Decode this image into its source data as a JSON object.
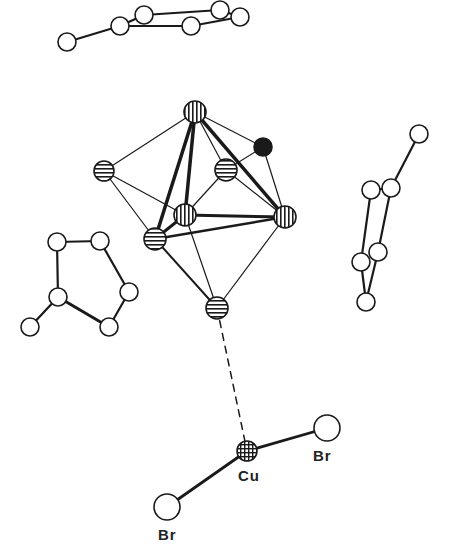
{
  "figure": {
    "colors": {
      "ink": "#1a1a1a",
      "paper": "#ffffff"
    }
  },
  "labels": [
    {
      "id": "cu",
      "text": "Cu",
      "x": 238,
      "y": 467
    },
    {
      "id": "br-right",
      "text": "Br",
      "x": 313,
      "y": 447
    },
    {
      "id": "br-left",
      "text": "Br",
      "x": 158,
      "y": 526
    }
  ],
  "atoms": [
    {
      "id": "r1a",
      "x": 67,
      "y": 42,
      "r": 9,
      "style": "open"
    },
    {
      "id": "r1b",
      "x": 120,
      "y": 26,
      "r": 9,
      "style": "open"
    },
    {
      "id": "r1c",
      "x": 144,
      "y": 15,
      "r": 9,
      "style": "open"
    },
    {
      "id": "r1d",
      "x": 191,
      "y": 26,
      "r": 9,
      "style": "open"
    },
    {
      "id": "r1e",
      "x": 220,
      "y": 10,
      "r": 9,
      "style": "open"
    },
    {
      "id": "r1f",
      "x": 240,
      "y": 17,
      "r": 9,
      "style": "open"
    },
    {
      "id": "c-top",
      "x": 195,
      "y": 112,
      "r": 11,
      "style": "vlines"
    },
    {
      "id": "c-black",
      "x": 263,
      "y": 147,
      "r": 9,
      "style": "filled"
    },
    {
      "id": "c-left",
      "x": 104,
      "y": 171,
      "r": 10,
      "style": "hlines"
    },
    {
      "id": "c-upmid",
      "x": 226,
      "y": 170,
      "r": 11,
      "style": "hlines"
    },
    {
      "id": "c-center",
      "x": 185,
      "y": 215,
      "r": 11,
      "style": "vlines"
    },
    {
      "id": "c-right",
      "x": 285,
      "y": 217,
      "r": 11,
      "style": "vlines"
    },
    {
      "id": "c-llow",
      "x": 155,
      "y": 239,
      "r": 11,
      "style": "hlines"
    },
    {
      "id": "c-bottom",
      "x": 217,
      "y": 308,
      "r": 11,
      "style": "hlines"
    },
    {
      "id": "r2a",
      "x": 419,
      "y": 134,
      "r": 9,
      "style": "open"
    },
    {
      "id": "r2b",
      "x": 371,
      "y": 190,
      "r": 9,
      "style": "open"
    },
    {
      "id": "r2c",
      "x": 391,
      "y": 188,
      "r": 9,
      "style": "open"
    },
    {
      "id": "r2d",
      "x": 378,
      "y": 252,
      "r": 9,
      "style": "open"
    },
    {
      "id": "r2e",
      "x": 361,
      "y": 262,
      "r": 9,
      "style": "open"
    },
    {
      "id": "r2f",
      "x": 366,
      "y": 302,
      "r": 9,
      "style": "open"
    },
    {
      "id": "r3a",
      "x": 57,
      "y": 242,
      "r": 9,
      "style": "open"
    },
    {
      "id": "r3b",
      "x": 100,
      "y": 241,
      "r": 9,
      "style": "open"
    },
    {
      "id": "r3c",
      "x": 129,
      "y": 292,
      "r": 9,
      "style": "open"
    },
    {
      "id": "r3d",
      "x": 58,
      "y": 297,
      "r": 9,
      "style": "open"
    },
    {
      "id": "r3e",
      "x": 109,
      "y": 327,
      "r": 9,
      "style": "open"
    },
    {
      "id": "r3f",
      "x": 30,
      "y": 327,
      "r": 9,
      "style": "open"
    },
    {
      "id": "cu",
      "x": 247,
      "y": 451,
      "r": 10,
      "style": "grid"
    },
    {
      "id": "br-r",
      "x": 327,
      "y": 428,
      "r": 13,
      "style": "open"
    },
    {
      "id": "br-l",
      "x": 167,
      "y": 507,
      "r": 13,
      "style": "open"
    }
  ],
  "bonds": [
    {
      "a": "r1a",
      "b": "r1b",
      "w": 2.2
    },
    {
      "a": "r1b",
      "b": "r1c",
      "w": 2.2
    },
    {
      "a": "r1c",
      "b": "r1e",
      "w": 2.2
    },
    {
      "a": "r1e",
      "b": "r1f",
      "w": 2.2
    },
    {
      "a": "r1f",
      "b": "r1d",
      "w": 2.2
    },
    {
      "a": "r1d",
      "b": "r1b",
      "w": 2.2
    },
    {
      "a": "c-top",
      "b": "c-left",
      "w": 1.2
    },
    {
      "a": "c-top",
      "b": "c-black",
      "w": 1.2
    },
    {
      "a": "c-top",
      "b": "c-upmid",
      "w": 1.2
    },
    {
      "a": "c-top",
      "b": "c-llow",
      "w": 3.5
    },
    {
      "a": "c-top",
      "b": "c-center",
      "w": 3.5
    },
    {
      "a": "c-top",
      "b": "c-right",
      "w": 3.5
    },
    {
      "a": "c-black",
      "b": "c-right",
      "w": 1.2
    },
    {
      "a": "c-black",
      "b": "c-upmid",
      "w": 1.2
    },
    {
      "a": "c-upmid",
      "b": "c-right",
      "w": 1.2
    },
    {
      "a": "c-upmid",
      "b": "c-center",
      "w": 1.2
    },
    {
      "a": "c-left",
      "b": "c-center",
      "w": 1.2
    },
    {
      "a": "c-left",
      "b": "c-llow",
      "w": 1.2
    },
    {
      "a": "c-center",
      "b": "c-right",
      "w": 3
    },
    {
      "a": "c-center",
      "b": "c-llow",
      "w": 3
    },
    {
      "a": "c-llow",
      "b": "c-right",
      "w": 2.5
    },
    {
      "a": "c-llow",
      "b": "c-bottom",
      "w": 2
    },
    {
      "a": "c-center",
      "b": "c-bottom",
      "w": 1.2
    },
    {
      "a": "c-right",
      "b": "c-bottom",
      "w": 1.2
    },
    {
      "a": "r2a",
      "b": "r2c",
      "w": 2.2
    },
    {
      "a": "r2b",
      "b": "r2c",
      "w": 2.2
    },
    {
      "a": "r2b",
      "b": "r2e",
      "w": 2.2
    },
    {
      "a": "r2c",
      "b": "r2d",
      "w": 2.2
    },
    {
      "a": "r2e",
      "b": "r2f",
      "w": 2.2
    },
    {
      "a": "r2d",
      "b": "r2f",
      "w": 2.2
    },
    {
      "a": "r3a",
      "b": "r3b",
      "w": 2.2
    },
    {
      "a": "r3a",
      "b": "r3d",
      "w": 2.2
    },
    {
      "a": "r3b",
      "b": "r3c",
      "w": 2.2
    },
    {
      "a": "r3c",
      "b": "r3e",
      "w": 2.2
    },
    {
      "a": "r3d",
      "b": "r3e",
      "w": 3
    },
    {
      "a": "r3d",
      "b": "r3f",
      "w": 2.2
    },
    {
      "a": "cu",
      "b": "br-r",
      "w": 2.8
    },
    {
      "a": "cu",
      "b": "br-l",
      "w": 2.8
    },
    {
      "a": "c-bottom",
      "b": "cu",
      "w": 1.5,
      "dashed": true
    }
  ]
}
